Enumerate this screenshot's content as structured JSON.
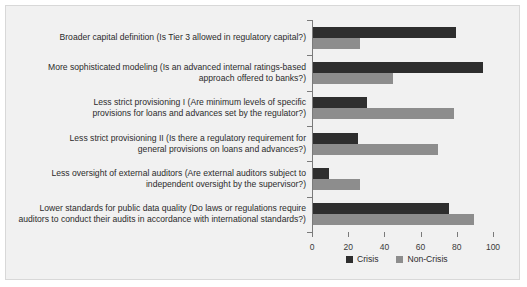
{
  "chart_data": {
    "type": "bar",
    "orientation": "horizontal",
    "title": "",
    "subtitle": "",
    "xlabel": "",
    "ylabel": "",
    "xlim": [
      0,
      100
    ],
    "xticks": [
      0,
      20,
      40,
      60,
      80,
      100
    ],
    "grid": false,
    "legend_position": "bottom",
    "categories": [
      "Broader capital definition (Is Tier 3 allowed in regulatory capital?)",
      "More sophisticated modeling (Is an advanced internal ratings-based approach offered to banks?)",
      "Less strict provisioning I (Are minimum levels of specific provisions for loans and advances set by the regulator?)",
      "Less strict provisioning II (Is there a regulatory requirement for general provisions on loans and advances?)",
      "Less oversight of external auditors (Are external auditors subject to independent oversight by the supervisor?)",
      "Lower standards for public data quality (Do laws or regulations require auditors to conduct their audits in accordance with international standards?)"
    ],
    "category_lines": [
      [
        "Broader capital definition (Is Tier 3 allowed in regulatory capital?)"
      ],
      [
        "More sophisticated modeling (Is an advanced internal ratings-based",
        "approach offered to banks?)"
      ],
      [
        "Less strict provisioning I (Are minimum levels of specific",
        "provisions for loans and advances set by the regulator?)"
      ],
      [
        "Less strict provisioning II (Is there a regulatory requirement for",
        "general provisions on loans and advances?)"
      ],
      [
        "Less oversight of external auditors (Are external auditors subject to",
        "independent oversight by the supervisor?)"
      ],
      [
        "Lower standards for public data quality (Do laws or regulations require",
        "auditors to conduct their audits in accordance with international standards?)"
      ]
    ],
    "series": [
      {
        "name": "Crisis",
        "color": "#2e2e2e",
        "values": [
          79,
          94,
          30,
          25,
          9,
          75
        ]
      },
      {
        "name": "Non-Crisis",
        "color": "#8d8d8d",
        "values": [
          26,
          44,
          78,
          69,
          26,
          89
        ]
      }
    ]
  },
  "legend": {
    "items": [
      {
        "label": "Crisis"
      },
      {
        "label": "Non-Crisis"
      }
    ]
  }
}
